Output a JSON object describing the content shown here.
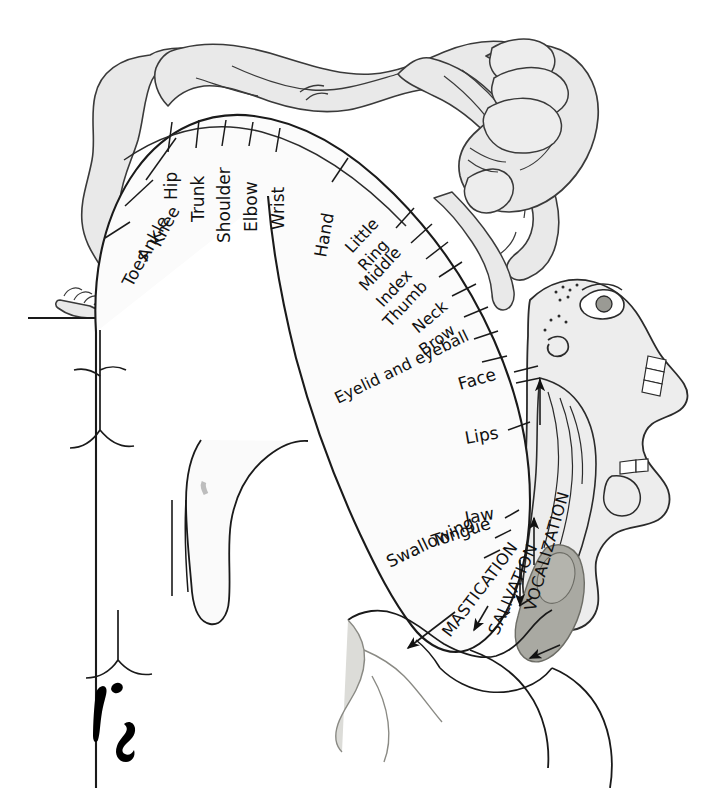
{
  "figure": {
    "name": "motor-homunculus",
    "background_color": "#ffffff",
    "ink_color": "#111111",
    "body_fill_color": "#e9e9e9",
    "cortex_fill_color": "#fbfbfb",
    "dark_fill_color": "#a9a9a2"
  },
  "labels": {
    "medial": [
      {
        "id": "toes",
        "text": "Toes"
      },
      {
        "id": "ankle",
        "text": "Ankle"
      },
      {
        "id": "knee",
        "text": "Knee"
      },
      {
        "id": "hip",
        "text": "Hip"
      },
      {
        "id": "trunk",
        "text": "Trunk"
      },
      {
        "id": "shoulder",
        "text": "Shoulder"
      },
      {
        "id": "elbow",
        "text": "Elbow"
      },
      {
        "id": "wrist",
        "text": "Wrist"
      },
      {
        "id": "hand",
        "text": "Hand"
      }
    ],
    "digits_and_face": [
      {
        "id": "little",
        "text": "Little"
      },
      {
        "id": "ring",
        "text": "Ring"
      },
      {
        "id": "middle",
        "text": "Middle"
      },
      {
        "id": "index",
        "text": "Index"
      },
      {
        "id": "thumb",
        "text": "Thumb"
      },
      {
        "id": "neck",
        "text": "Neck"
      },
      {
        "id": "brow",
        "text": "Brow"
      },
      {
        "id": "eyelid-and-eyeball",
        "text": "Eyelid and eyeball"
      },
      {
        "id": "face",
        "text": "Face"
      },
      {
        "id": "lips",
        "text": "Lips"
      },
      {
        "id": "jaw",
        "text": "Jaw"
      },
      {
        "id": "tongue",
        "text": "Tongue"
      },
      {
        "id": "swallowing",
        "text": "Swallowing"
      }
    ],
    "functions_uppercase": [
      {
        "id": "mastication",
        "text": "MASTICATION"
      },
      {
        "id": "salivation",
        "text": "SALIVATION"
      },
      {
        "id": "vocalization",
        "text": "VOCALIZATION"
      }
    ]
  }
}
